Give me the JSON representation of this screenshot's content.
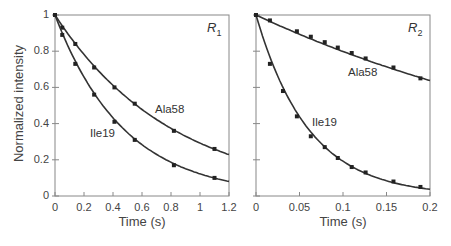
{
  "chart_data": [
    {
      "type": "scatter",
      "title": "R1",
      "title_main": "R",
      "title_sub": "1",
      "xlabel": "Time (s)",
      "ylabel": "Normalized intensity",
      "xlim": [
        0,
        1.2
      ],
      "ylim": [
        0,
        1
      ],
      "xticks": [
        "0",
        "0.2",
        "0.4",
        "0.6",
        "0.8",
        "1",
        "1.2"
      ],
      "yticks": [
        "0",
        "0.2",
        "0.4",
        "0.6",
        "0.8",
        "1"
      ],
      "grid": false,
      "fit_curves": true,
      "series": [
        {
          "name": "Ala58",
          "x": [
            0,
            0.05,
            0.14,
            0.27,
            0.41,
            0.55,
            0.82,
            1.1
          ],
          "y": [
            1.0,
            0.93,
            0.84,
            0.71,
            0.6,
            0.51,
            0.36,
            0.26
          ],
          "decay_rate": 1.23
        },
        {
          "name": "Ile19",
          "x": [
            0,
            0.05,
            0.14,
            0.27,
            0.41,
            0.55,
            0.82,
            1.1
          ],
          "y": [
            1.0,
            0.89,
            0.73,
            0.56,
            0.41,
            0.31,
            0.17,
            0.1
          ],
          "decay_rate": 2.1
        }
      ]
    },
    {
      "type": "scatter",
      "title": "R2",
      "title_main": "R",
      "title_sub": "2",
      "xlabel": "Time (s)",
      "ylabel": "",
      "xlim": [
        0,
        0.2
      ],
      "ylim": [
        0,
        1
      ],
      "xticks": [
        "0",
        "0.05",
        "0.1",
        "0.15",
        "0.2"
      ],
      "yticks": [],
      "grid": false,
      "fit_curves": true,
      "series": [
        {
          "name": "Ala58",
          "x": [
            0,
            0.016,
            0.047,
            0.063,
            0.079,
            0.094,
            0.11,
            0.126,
            0.158,
            0.189
          ],
          "y": [
            1.0,
            0.97,
            0.91,
            0.88,
            0.85,
            0.82,
            0.79,
            0.76,
            0.71,
            0.65
          ],
          "decay_rate": 2.25
        },
        {
          "name": "Ile19",
          "x": [
            0,
            0.016,
            0.031,
            0.047,
            0.063,
            0.079,
            0.094,
            0.11,
            0.126,
            0.158,
            0.189
          ],
          "y": [
            1.0,
            0.73,
            0.58,
            0.44,
            0.33,
            0.27,
            0.21,
            0.16,
            0.13,
            0.08,
            0.05
          ],
          "decay_rate": 16.5
        }
      ]
    }
  ],
  "labels": {
    "ylabel": "Normalized intensity",
    "xlabel_left": "Time (s)",
    "xlabel_right": "Time (s)",
    "left_title": "R",
    "left_title_sub": "1",
    "right_title": "R",
    "right_title_sub": "2",
    "left_ala": "Ala58",
    "left_ile": "Ile19",
    "right_ala": "Ala58",
    "right_ile": "Ile19"
  },
  "colors": {
    "axis": "#888888",
    "curve": "#333333",
    "marker": "#222222"
  }
}
